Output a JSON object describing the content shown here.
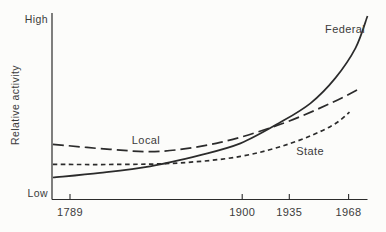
{
  "figure": {
    "background_color": "#fcfcfa",
    "line_color": "#2b2b2b",
    "text_color": "#3b3b3b"
  },
  "chart_data": {
    "type": "line",
    "title": "",
    "xlabel": "",
    "ylabel": "Relative activity",
    "y_axis": {
      "top_label": "High",
      "bottom_label": "Low",
      "scale": "qualitative, Low to High, no numeric ticks"
    },
    "x_ticks": [
      {
        "label": "1789",
        "pos": 0.057
      },
      {
        "label": "1900",
        "pos": 0.603
      },
      {
        "label": "1935",
        "pos": 0.752
      },
      {
        "label": "1968",
        "pos": 0.94
      }
    ],
    "grid": "off",
    "legend": "inline labels next to each curve",
    "point_units": "each point is [fraction along x-axis from 1789-era origin, relative activity fraction where 0 = Low and 1 = High]",
    "series": [
      {
        "name": "Federal",
        "line_style": "solid",
        "label_pos": [
          0.929,
          0.911
        ],
        "points": [
          [
            0.003,
            0.118
          ],
          [
            0.152,
            0.143
          ],
          [
            0.311,
            0.178
          ],
          [
            0.47,
            0.238
          ],
          [
            0.597,
            0.301
          ],
          [
            0.724,
            0.414
          ],
          [
            0.819,
            0.516
          ],
          [
            0.898,
            0.651
          ],
          [
            0.962,
            0.812
          ],
          [
            1.0,
            0.984
          ]
        ]
      },
      {
        "name": "Local",
        "line_style": "long-dash",
        "label_pos": [
          0.298,
          0.311
        ],
        "points": [
          [
            0.003,
            0.296
          ],
          [
            0.184,
            0.269
          ],
          [
            0.343,
            0.258
          ],
          [
            0.533,
            0.306
          ],
          [
            0.724,
            0.403
          ],
          [
            0.883,
            0.516
          ],
          [
            0.978,
            0.597
          ]
        ]
      },
      {
        "name": "State",
        "line_style": "short-dash",
        "label_pos": [
          0.818,
          0.252
        ],
        "points": [
          [
            0.003,
            0.188
          ],
          [
            0.216,
            0.188
          ],
          [
            0.406,
            0.196
          ],
          [
            0.597,
            0.231
          ],
          [
            0.756,
            0.301
          ],
          [
            0.883,
            0.392
          ],
          [
            0.943,
            0.468
          ]
        ]
      }
    ]
  }
}
